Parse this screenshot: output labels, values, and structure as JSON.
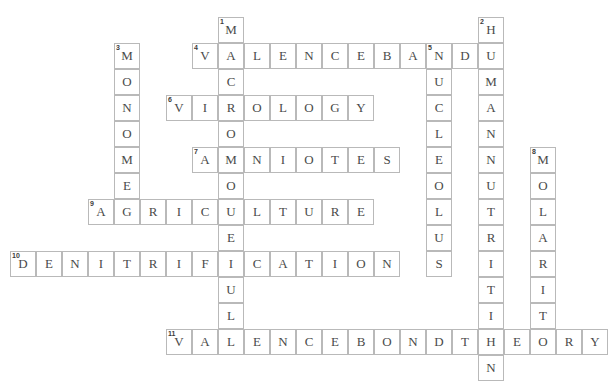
{
  "puzzle": {
    "title": "Biology Crossword Grid",
    "cell_size": 26,
    "origin_x": 10,
    "origin_y": 17,
    "grid_cols": 21,
    "grid_rows": 14,
    "colors": {
      "cell_border": "#b9b9b9",
      "cell_background": "#ffffff",
      "letter": "#4a4a4a",
      "number": "#3b3b3b",
      "page_background": "#ffffff"
    },
    "entries": [
      {
        "number": "1",
        "answer": "MACROMOLECULE",
        "direction": "down",
        "col": 8,
        "row": 0,
        "length": 13
      },
      {
        "number": "2",
        "answer": "HUMANNUTRITION",
        "direction": "down",
        "col": 18,
        "row": 0,
        "length": 14
      },
      {
        "number": "3",
        "answer": "MONOMER",
        "direction": "down",
        "col": 4,
        "row": 1,
        "length": 7
      },
      {
        "number": "4",
        "answer": "VALENCEBAND",
        "direction": "across",
        "col": 7,
        "row": 1,
        "length": 11
      },
      {
        "number": "5",
        "answer": "NUCLEOLUS",
        "direction": "down",
        "col": 16,
        "row": 1,
        "length": 9
      },
      {
        "number": "6",
        "answer": "VIROLOGY",
        "direction": "across",
        "col": 6,
        "row": 3,
        "length": 8
      },
      {
        "number": "7",
        "answer": "AMNIOTES",
        "direction": "across",
        "col": 7,
        "row": 5,
        "length": 8
      },
      {
        "number": "8",
        "answer": "MOLARITY",
        "direction": "down",
        "col": 20,
        "row": 5,
        "length": 8
      },
      {
        "number": "9",
        "answer": "AGRICULTURE",
        "direction": "across",
        "col": 3,
        "row": 7,
        "length": 11
      },
      {
        "number": "10",
        "answer": "DENITRIFICATION",
        "direction": "across",
        "col": 0,
        "row": 9,
        "length": 15
      },
      {
        "number": "11",
        "answer": "VALENCEBONDTHEORY",
        "direction": "across",
        "col": 6,
        "row": 12,
        "length": 17
      }
    ]
  }
}
